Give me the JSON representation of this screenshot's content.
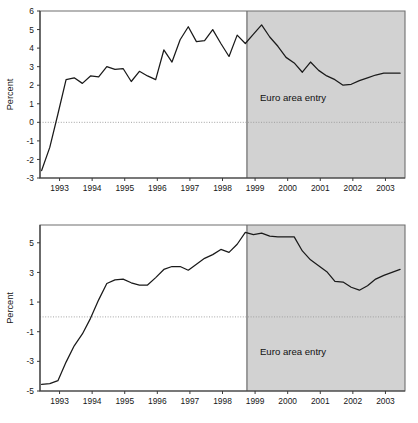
{
  "figure": {
    "width": 418,
    "height": 423,
    "background": "#ffffff",
    "shade_color": "#d2d2d2",
    "line_color": "#1a1a1a",
    "axis_color": "#3a3a3a"
  },
  "chart_data": [
    {
      "id": "top",
      "type": "line",
      "title": "",
      "xlabel": "",
      "ylabel": "Percent",
      "ylim": [
        -3,
        6
      ],
      "xlim": [
        1992.4,
        2003.6
      ],
      "yticks": [
        -3,
        -2,
        -1,
        0,
        1,
        2,
        3,
        4,
        5,
        6
      ],
      "ytick_labels": [
        "-3",
        "-2",
        "-1",
        "0",
        "1",
        "2",
        "3",
        "4",
        "5",
        "6"
      ],
      "xticks": [
        1993,
        1994,
        1995,
        1996,
        1997,
        1998,
        1999,
        2000,
        2001,
        2002,
        2003
      ],
      "xtick_labels": [
        "1993",
        "1994",
        "1995",
        "1996",
        "1997",
        "1998",
        "1999",
        "2000",
        "2001",
        "2002",
        "2003"
      ],
      "grid": false,
      "zero_line": 0,
      "legend": "none",
      "annotations": [
        {
          "text": "Euro area entry",
          "x": 1999.15,
          "y": 1.15
        }
      ],
      "shaded_region": {
        "x_start": 1998.75,
        "x_end": 2003.6,
        "label": "Euro area entry"
      },
      "x": [
        1992.45,
        1992.7,
        1992.95,
        1993.2,
        1993.45,
        1993.7,
        1993.95,
        1994.2,
        1994.45,
        1994.7,
        1994.95,
        1995.2,
        1995.45,
        1995.7,
        1995.95,
        1996.2,
        1996.45,
        1996.7,
        1996.95,
        1997.2,
        1997.45,
        1997.7,
        1997.95,
        1998.2,
        1998.45,
        1998.7,
        1998.95,
        1999.2,
        1999.45,
        1999.7,
        1999.95,
        2000.2,
        2000.45,
        2000.7,
        2000.95,
        2001.2,
        2001.45,
        2001.7,
        2001.95,
        2002.2,
        2002.45,
        2002.7,
        2002.95,
        2003.2,
        2003.45
      ],
      "y": [
        -2.6,
        -1.35,
        0.45,
        2.3,
        2.4,
        2.1,
        2.5,
        2.45,
        3.0,
        2.85,
        2.9,
        2.2,
        2.75,
        2.5,
        2.3,
        3.9,
        3.25,
        4.45,
        5.15,
        4.35,
        4.4,
        5.0,
        4.25,
        3.55,
        4.7,
        4.25,
        4.75,
        5.25,
        4.6,
        4.1,
        3.5,
        3.2,
        2.7,
        3.25,
        2.8,
        2.5,
        2.3,
        2.0,
        2.05,
        2.25,
        2.4,
        2.55,
        2.65,
        2.65,
        2.65
      ]
    },
    {
      "id": "bottom",
      "type": "line",
      "title": "",
      "xlabel": "",
      "ylabel": "Percent",
      "ylim": [
        -5,
        6.2
      ],
      "xlim": [
        1992.4,
        2003.6
      ],
      "yticks": [
        -5,
        -3,
        -1,
        1,
        3,
        5
      ],
      "ytick_labels": [
        "-5",
        "-3",
        "-1",
        "1",
        "3",
        "5"
      ],
      "xticks": [
        1993,
        1994,
        1995,
        1996,
        1997,
        1998,
        1999,
        2000,
        2001,
        2002,
        2003
      ],
      "xtick_labels": [
        "1993",
        "1994",
        "1995",
        "1996",
        "1997",
        "1998",
        "1999",
        "2000",
        "2001",
        "2002",
        "2003"
      ],
      "grid": false,
      "zero_line": 0,
      "legend": "none",
      "annotations": [
        {
          "text": "Euro area entry",
          "x": 1999.15,
          "y": -2.55
        }
      ],
      "shaded_region": {
        "x_start": 1998.75,
        "x_end": 2003.6,
        "label": "Euro area entry"
      },
      "x": [
        1992.45,
        1992.7,
        1992.95,
        1993.2,
        1993.45,
        1993.7,
        1993.95,
        1994.2,
        1994.45,
        1994.7,
        1994.95,
        1995.2,
        1995.45,
        1995.7,
        1995.95,
        1996.2,
        1996.45,
        1996.7,
        1996.95,
        1997.2,
        1997.45,
        1997.7,
        1997.95,
        1998.2,
        1998.45,
        1998.7,
        1998.95,
        1999.2,
        1999.45,
        1999.7,
        1999.95,
        2000.2,
        2000.45,
        2000.7,
        2000.95,
        2001.2,
        2001.45,
        2001.7,
        2001.95,
        2002.2,
        2002.45,
        2002.7,
        2002.95,
        2003.2,
        2003.45
      ],
      "y": [
        -4.55,
        -4.5,
        -4.3,
        -3.05,
        -1.95,
        -1.15,
        -0.1,
        1.15,
        2.25,
        2.5,
        2.55,
        2.3,
        2.15,
        2.15,
        2.65,
        3.2,
        3.4,
        3.4,
        3.15,
        3.55,
        3.95,
        4.2,
        4.55,
        4.35,
        4.9,
        5.7,
        5.55,
        5.65,
        5.45,
        5.4,
        5.4,
        5.4,
        4.45,
        3.85,
        3.45,
        3.05,
        2.4,
        2.35,
        2.0,
        1.8,
        2.1,
        2.55,
        2.8,
        3.0,
        3.2
      ]
    }
  ],
  "labels": {
    "percent_axis_title": "Percent",
    "euro_entry": "Euro area entry"
  }
}
